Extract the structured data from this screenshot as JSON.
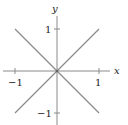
{
  "diagram": {
    "axes": {
      "x_label": "x",
      "y_label": "y",
      "x_ticks": [
        {
          "value": -1,
          "label": "−1"
        },
        {
          "value": 1,
          "label": "1"
        }
      ],
      "y_ticks": [
        {
          "value": 1,
          "label": "1"
        },
        {
          "value": -1,
          "label": "−1"
        }
      ]
    },
    "curves": [
      {
        "name": "y = x",
        "from": [
          -1,
          -1
        ],
        "to": [
          1,
          1
        ]
      },
      {
        "name": "y = -x",
        "from": [
          -1,
          1
        ],
        "to": [
          1,
          -1
        ]
      }
    ],
    "colors": {
      "curve": "#8c8c8c",
      "axis": "#7a7a7a",
      "text": "#222222"
    }
  }
}
